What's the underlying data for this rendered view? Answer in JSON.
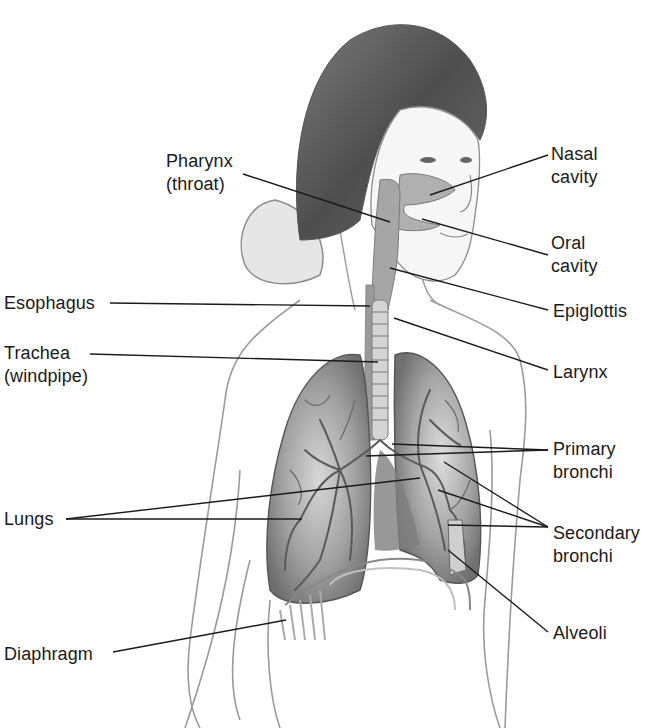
{
  "diagram": {
    "colors": {
      "background": "#ffffff",
      "line": "#1a1a1a",
      "lung_fill": "#8a8a8a",
      "airway_fill": "#a8a8a8",
      "skin_outline": "#9a9a9a",
      "hair": "#5a5a5a"
    },
    "labels": {
      "pharynx": "Pharynx\n(throat)",
      "nasal_cavity": "Nasal\ncavity",
      "oral_cavity": "Oral\ncavity",
      "epiglottis": "Epiglottis",
      "esophagus": "Esophagus",
      "trachea": "Trachea\n(windpipe)",
      "larynx": "Larynx",
      "primary_bronchi": "Primary\nbronchi",
      "lungs": "Lungs",
      "secondary_bronchi": "Secondary\nbronchi",
      "alveoli": "Alveoli",
      "diaphragm": "Diaphragm"
    }
  }
}
